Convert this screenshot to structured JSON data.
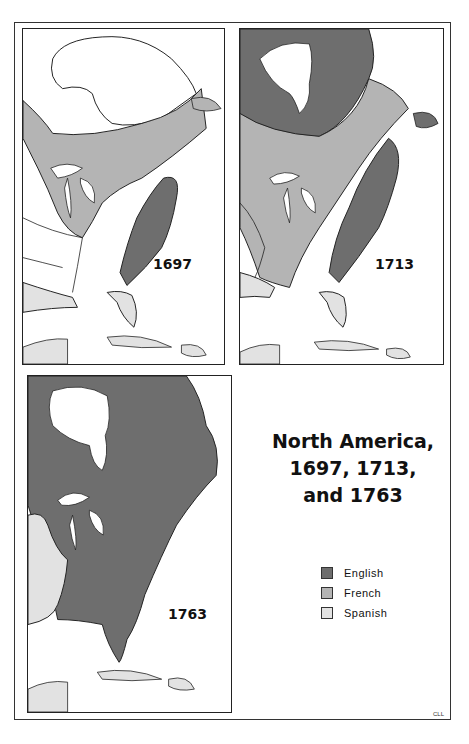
{
  "title": {
    "line1": "North America,",
    "line2": "1697, 1713,",
    "line3": "and 1763"
  },
  "maps": [
    {
      "year": "1697"
    },
    {
      "year": "1713"
    },
    {
      "year": "1763"
    }
  ],
  "legend": [
    {
      "label": "English",
      "color": "#6e6e6e"
    },
    {
      "label": "French",
      "color": "#b4b4b4"
    },
    {
      "label": "Spanish",
      "color": "#e2e2e2"
    }
  ],
  "credit": "CLL",
  "colors": {
    "english": "#6e6e6e",
    "french": "#b4b4b4",
    "spanish": "#e2e2e2",
    "unclaimed": "#ffffff",
    "border": "#222222"
  }
}
